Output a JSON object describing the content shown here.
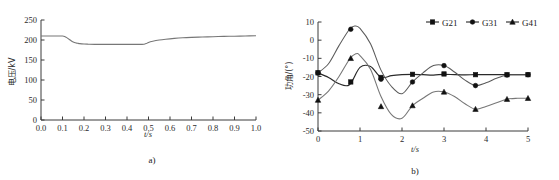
{
  "figure": {
    "panel_a_caption": "a)",
    "panel_b_caption": "b)"
  },
  "chart_data": [
    {
      "id": "panel-a",
      "type": "line",
      "title": "",
      "caption": "a)",
      "xlabel": "t/s",
      "ylabel": "电压/kV",
      "xlim": [
        0.0,
        1.0
      ],
      "ylim": [
        0,
        250
      ],
      "grid": false,
      "legend": "none",
      "xticks": [
        "0.0",
        "0.1",
        "0.2",
        "0.3",
        "0.4",
        "0.5",
        "0.6",
        "0.7",
        "0.8",
        "0.9",
        "1.0"
      ],
      "xtick_values": [
        0.0,
        0.1,
        0.2,
        0.3,
        0.4,
        0.5,
        0.6,
        0.7,
        0.8,
        0.9,
        1.0
      ],
      "yticks": [
        "0",
        "50",
        "100",
        "150",
        "200",
        "250"
      ],
      "ytick_values": [
        0,
        50,
        100,
        150,
        200,
        250
      ],
      "series": [
        {
          "name": "voltage",
          "color": "#777777",
          "x": [
            0.0,
            0.02,
            0.04,
            0.06,
            0.08,
            0.1,
            0.11,
            0.12,
            0.13,
            0.14,
            0.15,
            0.16,
            0.17,
            0.18,
            0.2,
            0.22,
            0.25,
            0.3,
            0.35,
            0.4,
            0.44,
            0.47,
            0.48,
            0.49,
            0.5,
            0.52,
            0.55,
            0.58,
            0.62,
            0.66,
            0.7,
            0.75,
            0.8,
            0.85,
            0.9,
            0.95,
            1.0
          ],
          "y": [
            210,
            210,
            210,
            210,
            210,
            210,
            209,
            206,
            202,
            198,
            195,
            193,
            192,
            191,
            190,
            189.5,
            189,
            189,
            189,
            189,
            189,
            189,
            189.5,
            191,
            194,
            197,
            200,
            202,
            204,
            205.5,
            206.5,
            207.5,
            208.3,
            209,
            209.5,
            210,
            210.5
          ]
        }
      ]
    },
    {
      "id": "panel-b",
      "type": "line",
      "title": "",
      "caption": "b)",
      "xlabel": "t/s",
      "ylabel": "功角/(°)",
      "xlim": [
        0,
        5
      ],
      "ylim": [
        -50,
        10
      ],
      "grid": false,
      "legend": "top-right",
      "xticks": [
        "0",
        "1",
        "2",
        "3",
        "4",
        "5"
      ],
      "xtick_values": [
        0,
        1,
        2,
        3,
        4,
        5
      ],
      "yticks": [
        "10",
        "0",
        "-10",
        "-20",
        "-30",
        "-40",
        "-50"
      ],
      "ytick_values": [
        10,
        0,
        -10,
        -20,
        -30,
        -40,
        -50
      ],
      "series": [
        {
          "name": "G21",
          "marker": "square",
          "color": "#2a2a2a",
          "x": [
            0.0,
            0.25,
            0.5,
            0.75,
            1.0,
            1.25,
            1.5,
            1.75,
            2.0,
            2.25,
            2.5,
            2.75,
            3.0,
            3.25,
            3.5,
            3.75,
            4.0,
            4.25,
            4.5,
            4.75,
            5.0
          ],
          "y": [
            -18.0,
            -20.5,
            -24.0,
            -24.5,
            -15.0,
            -14.5,
            -20.5,
            -19.5,
            -19.0,
            -18.8,
            -19.0,
            -19.2,
            -18.8,
            -19.0,
            -19.1,
            -19.0,
            -19.0,
            -19.0,
            -19.0,
            -19.0,
            -19.0
          ],
          "marker_x": [
            0.0,
            0.78,
            1.5,
            2.25,
            3.0,
            3.75,
            4.5,
            5.0
          ],
          "marker_y": [
            -18.0,
            -23.0,
            -20.5,
            -18.8,
            -18.6,
            -19.0,
            -19.0,
            -19.0
          ]
        },
        {
          "name": "G31",
          "marker": "circle",
          "color": "#5a5a5a",
          "x": [
            0.0,
            0.25,
            0.5,
            0.75,
            0.88,
            1.0,
            1.25,
            1.5,
            1.75,
            2.0,
            2.25,
            2.5,
            2.75,
            3.0,
            3.25,
            3.5,
            3.75,
            4.0,
            4.25,
            4.5,
            4.75,
            5.0
          ],
          "y": [
            -18.0,
            -13.0,
            -3.0,
            6.0,
            7.8,
            6.5,
            -2.0,
            -16.5,
            -25.5,
            -29.5,
            -23.0,
            -18.0,
            -14.0,
            -14.0,
            -17.5,
            -22.0,
            -25.0,
            -23.5,
            -21.0,
            -19.2,
            -19.0,
            -19.0
          ],
          "marker_x": [
            0.0,
            0.78,
            1.5,
            2.25,
            3.0,
            3.75,
            4.5,
            5.0
          ],
          "marker_y": [
            -18.0,
            6.0,
            -21.5,
            -23.0,
            -14.0,
            -25.0,
            -19.2,
            -19.0
          ]
        },
        {
          "name": "G41",
          "marker": "triangle",
          "color": "#6a6a6a",
          "x": [
            0.0,
            0.25,
            0.5,
            0.75,
            0.9,
            1.0,
            1.25,
            1.5,
            1.75,
            2.0,
            2.25,
            2.5,
            2.75,
            3.0,
            3.25,
            3.5,
            3.75,
            4.0,
            4.25,
            4.5,
            4.75,
            5.0
          ],
          "y": [
            -33.0,
            -28.0,
            -20.0,
            -10.5,
            -7.5,
            -8.5,
            -16.0,
            -31.0,
            -41.0,
            -43.0,
            -36.0,
            -32.0,
            -28.5,
            -28.5,
            -31.0,
            -35.0,
            -38.0,
            -36.5,
            -34.5,
            -32.5,
            -32.0,
            -32.0
          ],
          "marker_x": [
            0.0,
            0.78,
            1.5,
            2.25,
            3.0,
            3.75,
            4.5,
            5.0
          ],
          "marker_y": [
            -33.0,
            -10.0,
            -36.5,
            -36.0,
            -28.5,
            -38.0,
            -32.5,
            -32.0
          ]
        }
      ]
    }
  ],
  "panel_a": {
    "xlabel": "t/s",
    "ylabel": "电压/kV",
    "caption": "a)"
  },
  "panel_b": {
    "xlabel": "t/s",
    "ylabel": "功角/(°)",
    "caption": "b)",
    "legend": [
      {
        "label": "G21",
        "marker": "square"
      },
      {
        "label": "G31",
        "marker": "circle"
      },
      {
        "label": "G41",
        "marker": "triangle"
      }
    ]
  }
}
